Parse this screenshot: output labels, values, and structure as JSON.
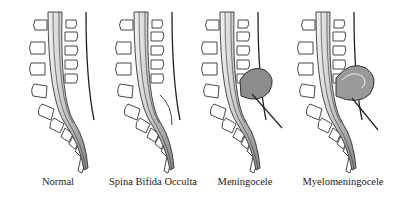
{
  "diagram": {
    "panels": [
      {
        "id": "normal",
        "label": "Normal"
      },
      {
        "id": "spina-bifida-occulta",
        "label": "Spina Bifida Occulta"
      },
      {
        "id": "meningocele",
        "label": "Meningocele"
      },
      {
        "id": "myelomeningocele",
        "label": "Myelomeningocele"
      }
    ],
    "colors": {
      "outline": "#333333",
      "cord_fill": "#bfbfbf",
      "sac_fill": "#8c8c8c",
      "background": "#ffffff"
    }
  }
}
